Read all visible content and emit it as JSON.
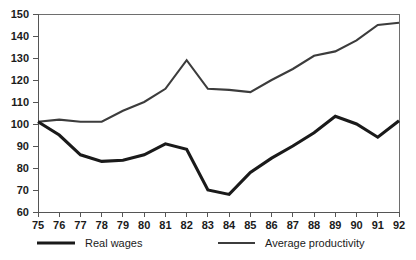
{
  "chart_data": {
    "type": "line",
    "title": "",
    "xlabel": "",
    "ylabel": "",
    "x": [
      75,
      76,
      77,
      78,
      79,
      80,
      81,
      82,
      83,
      84,
      85,
      86,
      87,
      88,
      89,
      90,
      91,
      92
    ],
    "xtick_labels": [
      "75",
      "76",
      "77",
      "78",
      "79",
      "80",
      "81",
      "82",
      "83",
      "84",
      "85",
      "86",
      "87",
      "88",
      "89",
      "90",
      "91",
      "92"
    ],
    "ytick_labels": [
      "60",
      "70",
      "80",
      "90",
      "100",
      "110",
      "120",
      "130",
      "140",
      "150"
    ],
    "yticks": [
      60,
      70,
      80,
      90,
      100,
      110,
      120,
      130,
      140,
      150
    ],
    "xlim": [
      75,
      92
    ],
    "ylim": [
      60,
      150
    ],
    "grid": false,
    "legend_position": "bottom",
    "series": [
      {
        "name": "Real wages",
        "color": "#1a1a1a",
        "values": [
          101,
          95,
          86,
          83,
          83.5,
          86,
          91,
          88.5,
          70,
          68,
          78,
          84.5,
          90,
          96,
          103.5,
          100,
          94,
          101.5
        ]
      },
      {
        "name": "Average productivity",
        "color": "#3c3c3c",
        "values": [
          101,
          102,
          101,
          101,
          106,
          110,
          116,
          129,
          116,
          115.5,
          114.5,
          120,
          125,
          131,
          133,
          138,
          145,
          146
        ]
      }
    ]
  },
  "legend": {
    "items": [
      {
        "label": "Real wages"
      },
      {
        "label": "Average productivity"
      }
    ]
  }
}
